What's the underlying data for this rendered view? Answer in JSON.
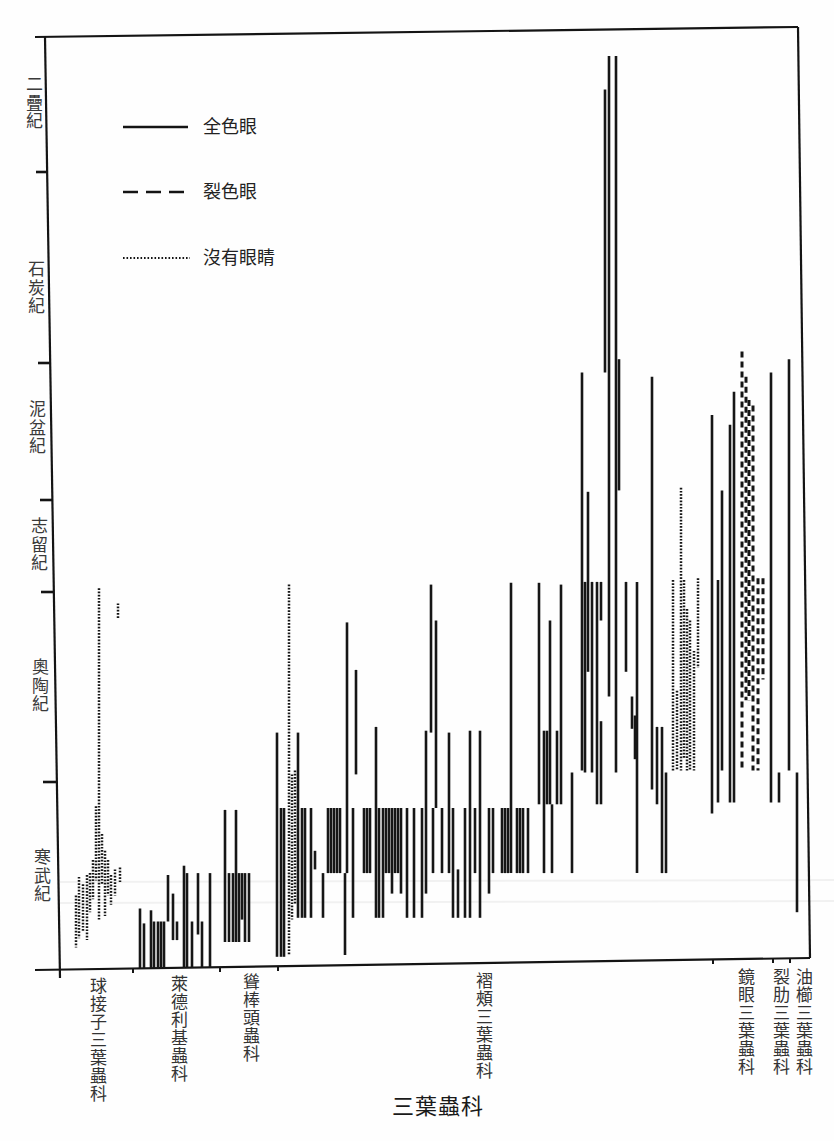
{
  "chart_data": {
    "type": "bar",
    "variant": "floating vertical range bars (stratigraphic range chart)",
    "title": "",
    "xlabel": "三葉蟲科",
    "ylabel": "",
    "y_scale": "geologic period index: 0 = base of 寒武紀, 6 = top of 二疊紀",
    "ylim": [
      0,
      6
    ],
    "grid": false,
    "legend_position": "upper-left, inside plot",
    "legend": [
      {
        "label": "全色眼",
        "style": "solid"
      },
      {
        "label": "裂色眼",
        "style": "dashed"
      },
      {
        "label": "沒有眼睛",
        "style": "dotted"
      }
    ],
    "periods": [
      {
        "name": "寒武紀",
        "from": 0,
        "to": 1
      },
      {
        "name": "奧陶紀",
        "from": 1,
        "to": 2
      },
      {
        "name": "志留紀",
        "from": 2,
        "to": 3
      },
      {
        "name": "泥盆紀",
        "from": 3,
        "to": 4
      },
      {
        "name": "石炭紀",
        "from": 4,
        "to": 5
      },
      {
        "name": "二疊紀",
        "from": 5,
        "to": 6
      }
    ],
    "categories": [
      "球接子三葉蟲科",
      "萊德利基蟲科",
      "聳棒頭蟲科",
      "褶頰三葉蟲科",
      "鏡眼三葉蟲科",
      "裂肋三葉蟲科",
      "油櫛三葉蟲科"
    ],
    "bar_fields": [
      "x_px",
      "top",
      "bottom",
      "eye_style"
    ],
    "series": [
      {
        "family": "球接子三葉蟲科",
        "bars": [
          [
            76,
            0.39,
            0.11,
            "dotted"
          ],
          [
            79,
            0.49,
            0.16,
            "dotted"
          ],
          [
            83,
            0.45,
            0.2,
            "dotted"
          ],
          [
            87,
            0.5,
            0.15,
            "dotted"
          ],
          [
            90,
            0.51,
            0.3,
            "dotted"
          ],
          [
            93,
            0.58,
            0.37,
            "dotted"
          ],
          [
            96,
            0.87,
            0.47,
            "dotted"
          ],
          [
            99,
            2.04,
            0.26,
            "dotted"
          ],
          [
            102,
            0.72,
            0.45,
            "dotted"
          ],
          [
            105,
            0.63,
            0.28,
            "dotted"
          ],
          [
            108,
            0.58,
            0.39,
            "dotted"
          ],
          [
            111,
            0.5,
            0.34,
            "dotted"
          ],
          [
            115,
            0.53,
            0.39,
            "dotted"
          ],
          [
            118,
            1.94,
            1.86,
            "dotted"
          ],
          [
            120,
            0.54,
            0.46,
            "dotted"
          ]
        ]
      },
      {
        "family": "萊德利基蟲科",
        "bars": [
          [
            140,
            0.32,
            0,
            "solid"
          ],
          [
            144,
            0.24,
            0,
            "solid"
          ],
          [
            151,
            0.31,
            0,
            "solid"
          ],
          [
            154,
            0.25,
            0,
            "solid"
          ],
          [
            158,
            0.25,
            0,
            "solid"
          ],
          [
            161,
            0.25,
            0,
            "solid"
          ],
          [
            164,
            0.25,
            0,
            "solid"
          ],
          [
            168,
            0.5,
            0.25,
            "solid"
          ],
          [
            173,
            0.4,
            0.15,
            "solid"
          ],
          [
            177,
            0.25,
            0.15,
            "solid"
          ],
          [
            184,
            0.55,
            0,
            "solid"
          ],
          [
            187,
            0.51,
            0,
            "solid"
          ],
          [
            192,
            0.25,
            0,
            "solid"
          ],
          [
            198,
            0.51,
            0.18,
            "solid"
          ],
          [
            202,
            0.25,
            0,
            "solid"
          ],
          [
            210,
            0.51,
            0,
            "solid"
          ]
        ]
      },
      {
        "family": "聳棒頭蟲科",
        "bars": [
          [
            225,
            0.85,
            0.14,
            "solid"
          ],
          [
            229,
            0.51,
            0.14,
            "solid"
          ],
          [
            233,
            0.51,
            0.14,
            "solid"
          ],
          [
            236,
            0.85,
            0.14,
            "solid"
          ],
          [
            239,
            0.51,
            0.14,
            "solid"
          ],
          [
            242,
            0.51,
            0.26,
            "solid"
          ],
          [
            245,
            0.51,
            0.14,
            "solid"
          ],
          [
            249,
            0.51,
            0.14,
            "solid"
          ]
        ]
      },
      {
        "family": "褶頰三葉蟲科",
        "bars": [
          [
            277,
            1.26,
            0.06,
            "solid"
          ],
          [
            281,
            0.86,
            0.06,
            "solid"
          ],
          [
            284,
            0.86,
            0.06,
            "solid"
          ],
          [
            289,
            2.08,
            0.07,
            "dotted"
          ],
          [
            292,
            1.04,
            0.26,
            "dotted"
          ],
          [
            295,
            1.06,
            0.34,
            "dotted"
          ],
          [
            298,
            1.26,
            0.27,
            "solid"
          ],
          [
            302,
            0.86,
            0.27,
            "solid"
          ],
          [
            305,
            0.86,
            0.27,
            "solid"
          ],
          [
            311,
            0.86,
            0.27,
            "solid"
          ],
          [
            315,
            0.63,
            0.53,
            "solid"
          ],
          [
            323,
            0.51,
            0.27,
            "solid"
          ],
          [
            328,
            0.86,
            0.51,
            "solid"
          ],
          [
            331,
            0.86,
            0.51,
            "solid"
          ],
          [
            334,
            0.86,
            0.51,
            "solid"
          ],
          [
            337,
            0.86,
            0.51,
            "solid"
          ],
          [
            340,
            0.86,
            0.51,
            "solid"
          ],
          [
            345,
            0.51,
            0.07,
            "solid"
          ],
          [
            347,
            1.84,
            0.51,
            "solid"
          ],
          [
            353,
            0.86,
            0.27,
            "solid"
          ],
          [
            356,
            1.59,
            1.04,
            "solid"
          ],
          [
            364,
            0.86,
            0.51,
            "solid"
          ],
          [
            367,
            0.86,
            0.51,
            "solid"
          ],
          [
            370,
            0.86,
            0.51,
            "solid"
          ],
          [
            376,
            1.29,
            0.27,
            "solid"
          ],
          [
            379,
            0.86,
            0.27,
            "solid"
          ],
          [
            383,
            0.86,
            0.27,
            "solid"
          ],
          [
            386,
            0.86,
            0.51,
            "solid"
          ],
          [
            389,
            0.86,
            0.51,
            "solid"
          ],
          [
            392,
            0.86,
            0.4,
            "solid"
          ],
          [
            395,
            0.86,
            0.51,
            "solid"
          ],
          [
            398,
            0.86,
            0.51,
            "solid"
          ],
          [
            401,
            0.86,
            0.4,
            "solid"
          ],
          [
            407,
            0.86,
            0.27,
            "solid"
          ],
          [
            414,
            0.86,
            0.27,
            "solid"
          ],
          [
            422,
            0.86,
            0.27,
            "solid"
          ],
          [
            426,
            1.27,
            0.4,
            "solid"
          ],
          [
            431,
            2.08,
            1.26,
            "solid"
          ],
          [
            433,
            0.86,
            0.51,
            "solid"
          ],
          [
            436,
            1.85,
            0.86,
            "solid"
          ],
          [
            442,
            0.86,
            0.51,
            "solid"
          ],
          [
            449,
            1.26,
            0.51,
            "solid"
          ],
          [
            453,
            0.86,
            0.27,
            "solid"
          ],
          [
            458,
            0.53,
            0.27,
            "solid"
          ],
          [
            465,
            0.86,
            0.27,
            "solid"
          ],
          [
            470,
            1.27,
            0.27,
            "solid"
          ],
          [
            475,
            0.86,
            0.51,
            "solid"
          ],
          [
            480,
            1.27,
            0.27,
            "solid"
          ],
          [
            489,
            0.86,
            0.4,
            "solid"
          ],
          [
            493,
            0.86,
            0.51,
            "solid"
          ],
          [
            502,
            0.86,
            0.51,
            "solid"
          ],
          [
            505,
            0.86,
            0.51,
            "solid"
          ],
          [
            508,
            0.86,
            0.51,
            "solid"
          ],
          [
            511,
            2.1,
            0.51,
            "solid"
          ],
          [
            517,
            0.86,
            0.51,
            "solid"
          ],
          [
            520,
            0.86,
            0.51,
            "solid"
          ],
          [
            523,
            0.86,
            0.51,
            "solid"
          ],
          [
            528,
            0.86,
            0.51,
            "solid"
          ],
          [
            539,
            2.1,
            0.88,
            "solid"
          ],
          [
            544,
            1.27,
            0.51,
            "solid"
          ],
          [
            547,
            1.27,
            0.88,
            "solid"
          ],
          [
            550,
            1.85,
            0.88,
            "solid"
          ],
          [
            552,
            0.88,
            0.51,
            "solid"
          ],
          [
            557,
            1.27,
            0.88,
            "solid"
          ],
          [
            561,
            2.08,
            0.88,
            "solid"
          ],
          [
            572,
            1.05,
            0.51,
            "solid"
          ],
          [
            582,
            3.93,
            1.06,
            "solid"
          ],
          [
            585,
            2.11,
            1.05,
            "solid"
          ],
          [
            588,
            3.06,
            1.58,
            "solid"
          ],
          [
            592,
            2.11,
            1.05,
            "solid"
          ],
          [
            597,
            2.11,
            0.88,
            "solid"
          ],
          [
            601,
            2.11,
            1.85,
            "solid"
          ],
          [
            601,
            1.32,
            0.88,
            "solid"
          ],
          [
            605,
            5.61,
            3.93,
            "solid"
          ],
          [
            609,
            5.86,
            1.45,
            "solid"
          ],
          [
            616,
            5.86,
            1.05,
            "solid"
          ],
          [
            619,
            4.02,
            3.07,
            "solid"
          ],
          [
            626,
            2.11,
            1.58,
            "solid"
          ],
          [
            632,
            1.45,
            1.28,
            "solid"
          ],
          [
            635,
            1.35,
            1.12,
            "solid"
          ],
          [
            637,
            2.11,
            0.51,
            "solid"
          ],
          [
            652,
            3.9,
            0.96,
            "solid"
          ],
          [
            657,
            1.29,
            0.88,
            "solid"
          ],
          [
            662,
            1.29,
            0.51,
            "solid"
          ],
          [
            666,
            1.05,
            0.51,
            "solid"
          ],
          [
            673,
            2.13,
            1.06,
            "dotted"
          ],
          [
            677,
            1.48,
            1.06,
            "dotted"
          ],
          [
            681,
            3.09,
            1.06,
            "dotted"
          ],
          [
            684,
            2.13,
            1.12,
            "dotted"
          ],
          [
            687,
            1.91,
            1.06,
            "dotted"
          ],
          [
            690,
            1.85,
            1.06,
            "dotted"
          ],
          [
            694,
            1.69,
            1.06,
            "dotted"
          ],
          [
            698,
            2.15,
            1.6,
            "dotted"
          ]
        ]
      },
      {
        "family": "鏡眼三葉蟲科",
        "bars": [
          [
            712,
            3.62,
            0.83,
            "solid"
          ],
          [
            718,
            2.13,
            0.89,
            "solid"
          ],
          [
            722,
            3.07,
            1.06,
            "solid"
          ],
          [
            730,
            3.55,
            0.89,
            "solid"
          ],
          [
            734,
            3.79,
            0.89,
            "solid"
          ],
          [
            742,
            4.06,
            1.06,
            "dashed"
          ],
          [
            746,
            3.9,
            1.43,
            "dashed"
          ],
          [
            749,
            3.73,
            1.43,
            "dashed"
          ],
          [
            753,
            3.69,
            1.06,
            "dashed"
          ],
          [
            758,
            2.15,
            1.06,
            "dashed"
          ],
          [
            763,
            2.15,
            1.54,
            "dashed"
          ]
        ]
      },
      {
        "family": "裂肋三葉蟲科",
        "bars": [
          [
            771,
            3.93,
            0.89,
            "solid"
          ],
          [
            779,
            1.05,
            0.89,
            "solid"
          ]
        ]
      },
      {
        "family": "油櫛三葉蟲科",
        "bars": [
          [
            789,
            4.02,
            1.06,
            "solid"
          ],
          [
            797,
            1.05,
            0.3,
            "solid"
          ]
        ]
      }
    ]
  }
}
